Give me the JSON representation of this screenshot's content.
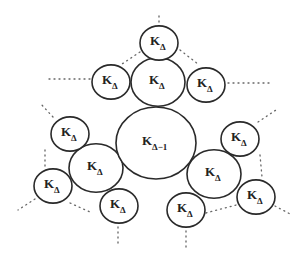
{
  "diagram": {
    "colors": {
      "stroke": "#2a2a2a",
      "background": "#ffffff",
      "dots": "#666666"
    },
    "center": {
      "label": "K",
      "subscript": "Δ−1",
      "cx": 156,
      "cy": 143,
      "r": 40
    },
    "nodes": [
      {
        "id": "top-hub",
        "label": "K",
        "subscript": "Δ",
        "cx": 158,
        "cy": 82,
        "r": 27
      },
      {
        "id": "top-top",
        "label": "K",
        "subscript": "Δ",
        "cx": 159,
        "cy": 43,
        "r": 19
      },
      {
        "id": "top-left",
        "label": "K",
        "subscript": "Δ",
        "cx": 111,
        "cy": 82,
        "r": 19
      },
      {
        "id": "top-right",
        "label": "K",
        "subscript": "Δ",
        "cx": 206,
        "cy": 85,
        "r": 19
      },
      {
        "id": "left-hub",
        "label": "K",
        "subscript": "Δ",
        "cx": 96,
        "cy": 168,
        "r": 27
      },
      {
        "id": "left-upper",
        "label": "K",
        "subscript": "Δ",
        "cx": 70,
        "cy": 134,
        "r": 19
      },
      {
        "id": "left-lower",
        "label": "K",
        "subscript": "Δ",
        "cx": 53,
        "cy": 186,
        "r": 19
      },
      {
        "id": "left-bottom",
        "label": "K",
        "subscript": "Δ",
        "cx": 119,
        "cy": 206,
        "r": 19
      },
      {
        "id": "right-hub",
        "label": "K",
        "subscript": "Δ",
        "cx": 214,
        "cy": 174,
        "r": 27
      },
      {
        "id": "right-upper",
        "label": "K",
        "subscript": "Δ",
        "cx": 240,
        "cy": 139,
        "r": 19
      },
      {
        "id": "right-lower",
        "label": "K",
        "subscript": "Δ",
        "cx": 256,
        "cy": 197,
        "r": 19
      },
      {
        "id": "right-bottom",
        "label": "K",
        "subscript": "Δ",
        "cx": 186,
        "cy": 210,
        "r": 19
      }
    ],
    "dotted_edges": [
      {
        "x1": 159,
        "y1": 22,
        "x2": 159,
        "y2": 12
      },
      {
        "x1": 140,
        "y1": 52,
        "x2": 122,
        "y2": 64
      },
      {
        "x1": 180,
        "y1": 50,
        "x2": 198,
        "y2": 64
      },
      {
        "x1": 90,
        "y1": 79,
        "x2": 48,
        "y2": 79
      },
      {
        "x1": 228,
        "y1": 83,
        "x2": 270,
        "y2": 83
      },
      {
        "x1": 53,
        "y1": 117,
        "x2": 40,
        "y2": 103
      },
      {
        "x1": 258,
        "y1": 122,
        "x2": 276,
        "y2": 110
      },
      {
        "x1": 45,
        "y1": 150,
        "x2": 45,
        "y2": 168
      },
      {
        "x1": 260,
        "y1": 155,
        "x2": 262,
        "y2": 177
      },
      {
        "x1": 35,
        "y1": 199,
        "x2": 18,
        "y2": 210
      },
      {
        "x1": 70,
        "y1": 203,
        "x2": 90,
        "y2": 212
      },
      {
        "x1": 118,
        "y1": 227,
        "x2": 118,
        "y2": 246
      },
      {
        "x1": 186,
        "y1": 231,
        "x2": 186,
        "y2": 250
      },
      {
        "x1": 206,
        "y1": 213,
        "x2": 236,
        "y2": 205
      },
      {
        "x1": 275,
        "y1": 206,
        "x2": 292,
        "y2": 215
      }
    ]
  }
}
